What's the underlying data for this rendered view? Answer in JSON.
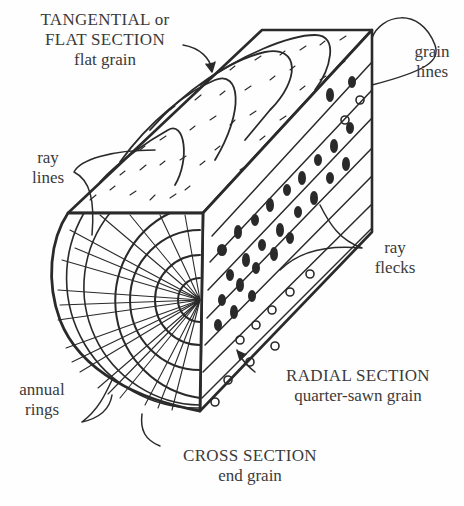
{
  "diagram": {
    "labels": {
      "tangential": {
        "line1": "TANGENTIAL or",
        "line2": "FLAT SECTION",
        "line3": "flat grain"
      },
      "grain_lines": {
        "line1": "grain",
        "line2": "lines"
      },
      "ray_lines": {
        "line1": "ray",
        "line2": "lines"
      },
      "ray_flecks": {
        "line1": "ray",
        "line2": "flecks"
      },
      "annual_rings": {
        "line1": "annual",
        "line2": "rings"
      },
      "radial": {
        "line1": "RADIAL SECTION",
        "line2": "quarter-sawn grain"
      },
      "cross": {
        "line1": "CROSS SECTION",
        "line2": "end grain"
      }
    },
    "colors": {
      "ink": "#2a2a2a",
      "text": "#3a3a3a",
      "background": "#fefefe"
    }
  }
}
